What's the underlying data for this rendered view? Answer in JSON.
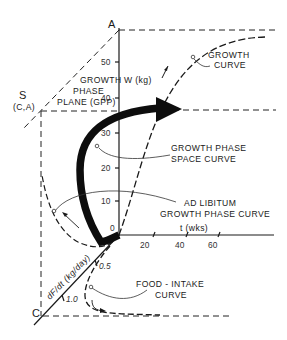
{
  "figure": {
    "axes": {
      "weight_axis": {
        "label": "W (kg)",
        "end_label": "A",
        "ticks": [
          "10",
          "20",
          "30",
          "40",
          "50"
        ]
      },
      "time_axis": {
        "label": "t (wks)",
        "ticks": [
          "20",
          "40",
          "60"
        ]
      },
      "food_axis": {
        "label": "dF/dt (kg/day)",
        "end_label": "C",
        "ticks": [
          "0.5",
          "1.0"
        ]
      },
      "origin_label": "0"
    },
    "point_s": {
      "label": "S",
      "sublabel": "(C,A)"
    },
    "plane_label": {
      "line1": "GROWTH",
      "line2": "PHASE",
      "line3": "PLANE (GPP)"
    },
    "callouts": {
      "growth_curve": {
        "line1": "GROWTH",
        "line2": "CURVE",
        "marker": "α"
      },
      "phase_space_curve": {
        "line1": "GROWTH PHASE",
        "line2": "SPACE CURVE",
        "marker": "α"
      },
      "ad_libitum": {
        "line1": "AD LIBITUM",
        "line2": "GROWTH PHASE CURVE",
        "marker": "α"
      },
      "food_intake": {
        "line1": "FOOD - INTAKE",
        "line2": "CURVE",
        "marker": "α"
      }
    },
    "colors": {
      "ink": "#1a1a1a",
      "background": "#ffffff"
    }
  }
}
